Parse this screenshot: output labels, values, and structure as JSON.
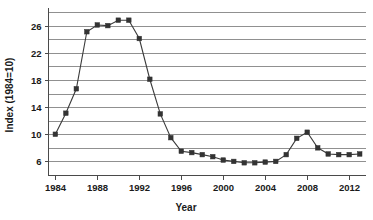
{
  "chart_data": {
    "type": "line",
    "title": "",
    "xlabel": "Year",
    "ylabel": "Index (1984=10)",
    "grid": true,
    "legend": "none",
    "xlim": [
      1983.3,
      2013.6
    ],
    "ylim": [
      4.0,
      28.3
    ],
    "x_ticks": [
      1984,
      1988,
      1992,
      1996,
      2000,
      2004,
      2008,
      2012
    ],
    "x_tick_labels": [
      "1984",
      "1988",
      "1992",
      "1996",
      "2000",
      "2004",
      "2008",
      "2012"
    ],
    "y_ticks": [
      6,
      10,
      14,
      18,
      22,
      26
    ],
    "y_tick_labels": [
      "6",
      "10",
      "14",
      "18",
      "22",
      "26"
    ],
    "y_gridlines": [
      4,
      6,
      8,
      10,
      12,
      14,
      16,
      18,
      20,
      22,
      24,
      26,
      28
    ],
    "marker": "square",
    "marker_color": "#333333",
    "line_color": "#3a3a3a",
    "grid_color": "#909090",
    "x": [
      1984,
      1985,
      1986,
      1987,
      1988,
      1989,
      1990,
      1991,
      1992,
      1993,
      1994,
      1995,
      1996,
      1997,
      1998,
      1999,
      2000,
      2001,
      2002,
      2003,
      2004,
      2005,
      2006,
      2007,
      2008,
      2009,
      2010,
      2011,
      2012,
      2013
    ],
    "values": [
      10.0,
      13.1,
      16.7,
      25.1,
      26.1,
      26.0,
      26.8,
      26.8,
      24.1,
      18.1,
      13.0,
      9.5,
      7.5,
      7.3,
      7.0,
      6.7,
      6.2,
      6.0,
      5.8,
      5.8,
      5.9,
      6.0,
      7.0,
      9.4,
      10.3,
      8.0,
      7.1,
      7.0,
      7.0,
      7.1
    ],
    "series": [
      {
        "name": "Index",
        "values": [
          10.0,
          13.1,
          16.7,
          25.1,
          26.1,
          26.0,
          26.8,
          26.8,
          24.1,
          18.1,
          13.0,
          9.5,
          7.5,
          7.3,
          7.0,
          6.7,
          6.2,
          6.0,
          5.8,
          5.8,
          5.9,
          6.0,
          7.0,
          9.4,
          10.3,
          8.0,
          7.1,
          7.0,
          7.0,
          7.1
        ]
      }
    ]
  }
}
